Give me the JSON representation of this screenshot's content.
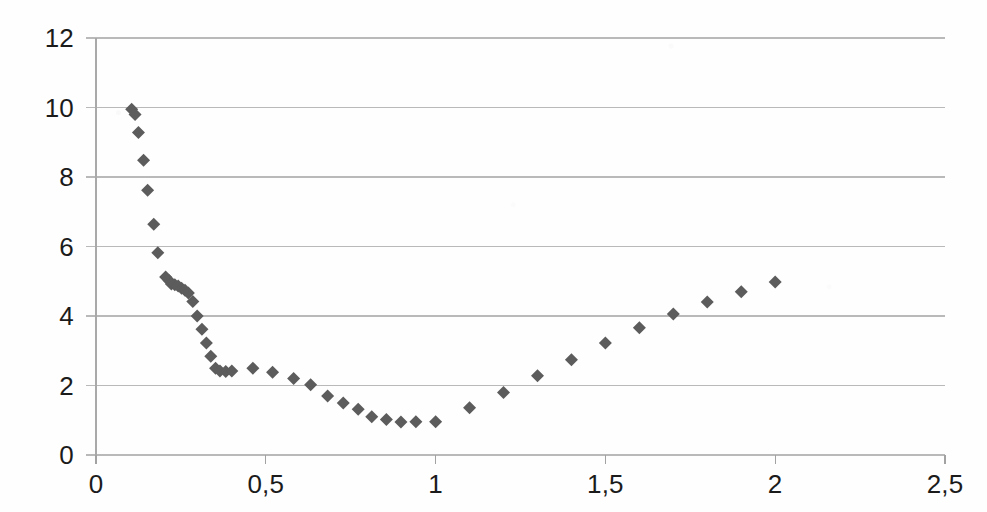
{
  "chart_data": {
    "type": "scatter",
    "title": "",
    "subtitle": "",
    "xlabel": "",
    "ylabel": "",
    "xlim": [
      0,
      2.5
    ],
    "ylim": [
      0,
      12
    ],
    "grid": true,
    "grid_axis": "y",
    "legend": null,
    "legend_position": "none",
    "marker": {
      "shape": "diamond",
      "color": "#5c5c5c",
      "size": 13
    },
    "decimal_separator": ",",
    "x_ticks": [
      0,
      0.5,
      1,
      1.5,
      2,
      2.5
    ],
    "x_tick_labels": [
      "0",
      "0,5",
      "1",
      "1,5",
      "2",
      "2,5"
    ],
    "y_ticks": [
      0,
      2,
      4,
      6,
      8,
      10,
      12
    ],
    "y_tick_labels": [
      "0",
      "2",
      "4",
      "6",
      "8",
      "10",
      "12"
    ],
    "points": [
      {
        "x": 0.105,
        "y": 9.95
      },
      {
        "x": 0.115,
        "y": 9.8
      },
      {
        "x": 0.125,
        "y": 9.28
      },
      {
        "x": 0.14,
        "y": 8.48
      },
      {
        "x": 0.152,
        "y": 7.62
      },
      {
        "x": 0.17,
        "y": 6.64
      },
      {
        "x": 0.182,
        "y": 5.82
      },
      {
        "x": 0.205,
        "y": 5.12
      },
      {
        "x": 0.215,
        "y": 5.02
      },
      {
        "x": 0.222,
        "y": 4.92
      },
      {
        "x": 0.232,
        "y": 4.9
      },
      {
        "x": 0.242,
        "y": 4.86
      },
      {
        "x": 0.252,
        "y": 4.8
      },
      {
        "x": 0.262,
        "y": 4.74
      },
      {
        "x": 0.272,
        "y": 4.66
      },
      {
        "x": 0.285,
        "y": 4.42
      },
      {
        "x": 0.298,
        "y": 4.0
      },
      {
        "x": 0.312,
        "y": 3.62
      },
      {
        "x": 0.325,
        "y": 3.22
      },
      {
        "x": 0.338,
        "y": 2.84
      },
      {
        "x": 0.352,
        "y": 2.5
      },
      {
        "x": 0.365,
        "y": 2.42
      },
      {
        "x": 0.382,
        "y": 2.4
      },
      {
        "x": 0.4,
        "y": 2.42
      },
      {
        "x": 0.462,
        "y": 2.5
      },
      {
        "x": 0.52,
        "y": 2.38
      },
      {
        "x": 0.582,
        "y": 2.2
      },
      {
        "x": 0.632,
        "y": 2.02
      },
      {
        "x": 0.682,
        "y": 1.7
      },
      {
        "x": 0.728,
        "y": 1.5
      },
      {
        "x": 0.772,
        "y": 1.32
      },
      {
        "x": 0.812,
        "y": 1.1
      },
      {
        "x": 0.855,
        "y": 1.02
      },
      {
        "x": 0.898,
        "y": 0.95
      },
      {
        "x": 0.942,
        "y": 0.96
      },
      {
        "x": 1.0,
        "y": 0.96
      },
      {
        "x": 1.1,
        "y": 1.36
      },
      {
        "x": 1.2,
        "y": 1.8
      },
      {
        "x": 1.3,
        "y": 2.28
      },
      {
        "x": 1.4,
        "y": 2.74
      },
      {
        "x": 1.5,
        "y": 3.22
      },
      {
        "x": 1.6,
        "y": 3.66
      },
      {
        "x": 1.7,
        "y": 4.06
      },
      {
        "x": 1.8,
        "y": 4.4
      },
      {
        "x": 1.9,
        "y": 4.7
      },
      {
        "x": 2.0,
        "y": 4.98
      }
    ]
  },
  "axes": {
    "y_axis_name": "y-axis",
    "x_axis_name": "x-axis"
  }
}
